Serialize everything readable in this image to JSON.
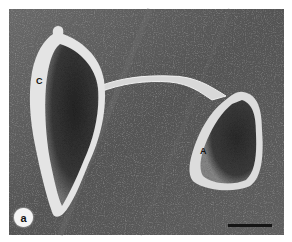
{
  "figure": {
    "type": "scanning electron micrograph",
    "panel_label": "a",
    "scale_bar": {
      "visible": true,
      "color": "#151515"
    }
  },
  "structures": [
    {
      "id": "C",
      "label": "C",
      "description": "elongated teardrop-shaped cell with textured surface"
    },
    {
      "id": "A",
      "label": "A",
      "description": "smaller pear-shaped cell connected by a tube"
    }
  ],
  "connector": {
    "description": "tubular bridge connecting cell C to cell A"
  },
  "colors": {
    "background": "#5a5a5a",
    "border": "#ffffff",
    "cell_rim": "#e8e8e8",
    "cell_interior": "#2a2a2a"
  }
}
